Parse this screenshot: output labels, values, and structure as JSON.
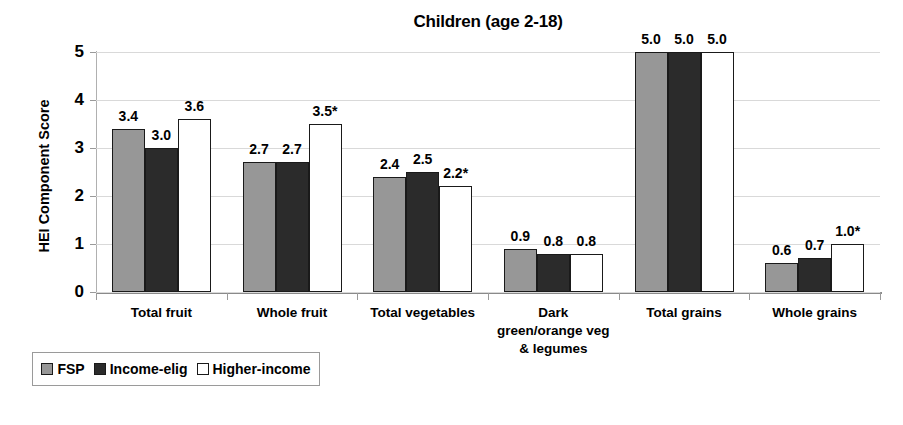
{
  "chart_data": {
    "type": "bar",
    "title": "Children (age 2-18)",
    "xlabel": "",
    "ylabel": "HEI Component Score",
    "ylim": [
      0,
      5
    ],
    "ytick_labels": [
      "0",
      "1",
      "2",
      "3",
      "4",
      "5"
    ],
    "grid": true,
    "legend_position": "bottom-left",
    "categories": [
      "Total fruit",
      "Whole fruit",
      "Total vegetables",
      "Dark green/orange veg & legumes",
      "Total grains",
      "Whole grains"
    ],
    "category_lines": [
      [
        "Total fruit"
      ],
      [
        "Whole fruit"
      ],
      [
        "Total vegetables"
      ],
      [
        "Dark",
        "green/orange veg",
        "& legumes"
      ],
      [
        "Total grains"
      ],
      [
        "Whole grains"
      ]
    ],
    "series": [
      {
        "name": "FSP",
        "color": "#979797",
        "values": [
          3.4,
          2.7,
          2.4,
          0.9,
          5.0,
          0.6
        ],
        "labels": [
          "3.4",
          "2.7",
          "2.4",
          "0.9",
          "5.0",
          "0.6"
        ]
      },
      {
        "name": "Income-elig",
        "color": "#2b2b2b",
        "values": [
          3.0,
          2.7,
          2.5,
          0.8,
          5.0,
          0.7
        ],
        "labels": [
          "3.0",
          "2.7",
          "2.5",
          "0.8",
          "5.0",
          "0.7"
        ]
      },
      {
        "name": "Higher-income",
        "color": "#ffffff",
        "values": [
          3.6,
          3.5,
          2.2,
          0.8,
          5.0,
          1.0
        ],
        "labels": [
          "3.6",
          "3.5*",
          "2.2*",
          "0.8",
          "5.0",
          "1.0*"
        ]
      }
    ]
  }
}
